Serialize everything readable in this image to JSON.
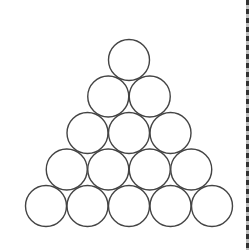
{
  "diagram": {
    "title": "",
    "shape": "circle",
    "stroke_color": "#444444",
    "fill_color": "#ffffff",
    "rows": [
      1,
      2,
      3,
      4,
      5
    ],
    "total_circles": 15
  },
  "edge": {
    "style": "dashed",
    "color": "#333333"
  }
}
